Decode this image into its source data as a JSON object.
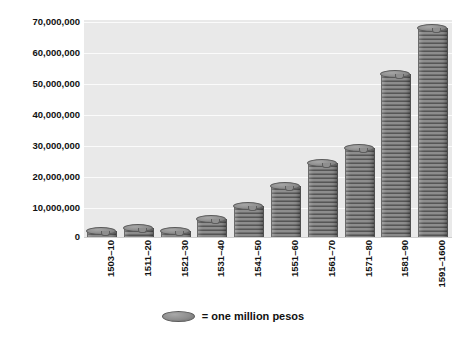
{
  "chart_data": {
    "type": "bar",
    "title": "",
    "subtitle": "",
    "xlabel": "",
    "ylabel": "",
    "grid": true,
    "legend_position": "bottom",
    "ylim": [
      0,
      70000000
    ],
    "yticks": [
      0,
      10000000,
      20000000,
      30000000,
      40000000,
      50000000,
      60000000,
      70000000
    ],
    "ytick_labels": [
      "0",
      "10,000,000",
      "20,000,000",
      "30,000,000",
      "40,000,000",
      "50,000,000",
      "60,000,000",
      "70,000,000"
    ],
    "categories": [
      "1503–10",
      "1511–20",
      "1521–30",
      "1531–40",
      "1541–50",
      "1551–60",
      "1561–70",
      "1571–80",
      "1581–90",
      "1591–1600"
    ],
    "values": [
      2000000,
      3000000,
      2000000,
      6000000,
      10000000,
      16500000,
      24000000,
      29000000,
      53000000,
      68000000
    ],
    "series": [
      {
        "name": "pesos",
        "values": [
          2000000,
          3000000,
          2000000,
          6000000,
          10000000,
          16500000,
          24000000,
          29000000,
          53000000,
          68000000
        ]
      }
    ],
    "legend": [
      {
        "symbol": "coin-ellipse",
        "label": "= one million pesos"
      }
    ],
    "annotations": []
  },
  "colors": {
    "plot_background": "#e9e9e9",
    "page_background": "#ffffff",
    "gridline": "#fbfbfb",
    "coin_face": "#8e8e8e",
    "coin_edge": "#5a5a5a",
    "text": "#111111"
  },
  "legend": {
    "coin_label": "= one million pesos"
  }
}
